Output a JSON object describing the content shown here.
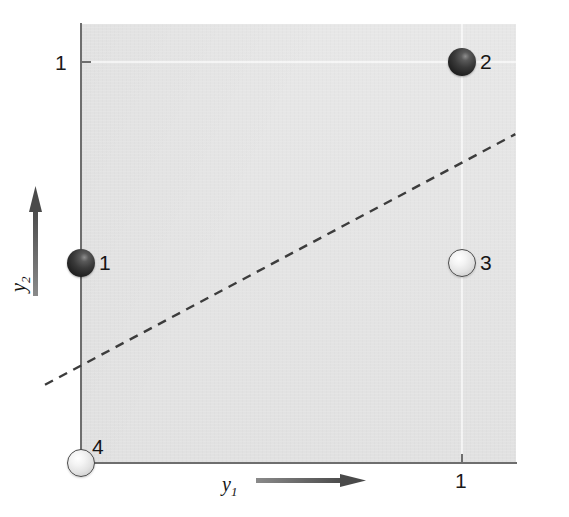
{
  "figure": {
    "name": "xor-scatter-diagram",
    "background_color": "#ffffff",
    "plot_background_color": "#e4e4e4"
  },
  "axes": {
    "x": {
      "label": "y",
      "subscript": "1",
      "tick_label": "1",
      "arrow_name": "x-axis-direction-arrow"
    },
    "y": {
      "label": "y",
      "subscript": "2",
      "tick_label": "1",
      "arrow_name": "y-axis-direction-arrow"
    }
  },
  "chart_data": {
    "type": "scatter",
    "title": "",
    "xlabel": "y1",
    "ylabel": "y2",
    "xlim": [
      0,
      1.14
    ],
    "ylim": [
      0,
      1.1
    ],
    "xticks": [
      1
    ],
    "yticks": [
      1
    ],
    "grid": true,
    "legend": "none",
    "points": [
      {
        "label": "1",
        "x": 0,
        "y": 0.5,
        "fill": "dark",
        "color": "#232323"
      },
      {
        "label": "2",
        "x": 1,
        "y": 1,
        "fill": "dark",
        "color": "#232323"
      },
      {
        "label": "3",
        "x": 1,
        "y": 0.5,
        "fill": "light",
        "color": "#f0f0f0"
      },
      {
        "label": "4",
        "x": 0,
        "y": 0,
        "fill": "light",
        "color": "#f0f0f0"
      }
    ],
    "annotations": [
      {
        "name": "decision-boundary",
        "type": "dashed-line",
        "x0": 0.0,
        "y0": 0.23,
        "x1": 1.14,
        "y1": 0.82,
        "color": "#3c3c3c",
        "style": "dashed"
      }
    ]
  }
}
